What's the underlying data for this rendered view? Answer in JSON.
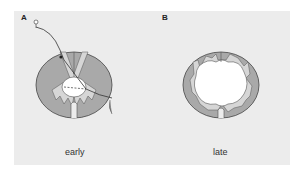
{
  "panels": [
    {
      "letter": "A",
      "caption": "early"
    },
    {
      "letter": "B",
      "caption": "late"
    }
  ],
  "colors": {
    "background": "#ececec",
    "white_matter": "#a9a9a9",
    "gray_matter": "#d6d6d6",
    "cavity": "#ffffff",
    "outline": "#444444"
  }
}
